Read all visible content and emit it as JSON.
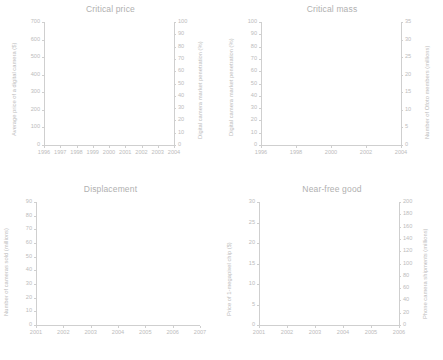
{
  "figure": {
    "layout": "2x2 grid of empty line-chart axes",
    "text_color": "#bcbcbc",
    "axis_color": "#cfcfcf",
    "background": "#ffffff"
  },
  "chart_data": [
    {
      "type": "line",
      "title": "Critical price",
      "xlabel": "",
      "ylabel": "Average price of a digital camera ($)",
      "y2label": "Digital camera market penetration (%)",
      "x": [
        "1996",
        "1997",
        "1998",
        "1999",
        "2000",
        "2001",
        "2002",
        "2003",
        "2004"
      ],
      "xticks": [
        "1996",
        "1997",
        "1998",
        "1999",
        "2000",
        "2001",
        "2002",
        "2003",
        "2004"
      ],
      "yticks": [
        "0",
        "100",
        "200",
        "300",
        "400",
        "500",
        "600",
        "700"
      ],
      "y2ticks": [
        "0",
        "10",
        "20",
        "30",
        "40",
        "50",
        "60",
        "70",
        "80",
        "90",
        "100"
      ],
      "ylim": [
        0,
        700
      ],
      "y2lim": [
        0,
        100
      ],
      "grid": false,
      "legend": "none",
      "series": []
    },
    {
      "type": "line",
      "title": "Critical mass",
      "xlabel": "",
      "ylabel": "Digital camera market penetration (%)",
      "y2label": "Number of Ofoto members (millions)",
      "x": [
        "1996",
        "1998",
        "2000",
        "2002",
        "2004"
      ],
      "xticks": [
        "1996",
        "1998",
        "2000",
        "2002",
        "2004"
      ],
      "yticks": [
        "0",
        "10",
        "20",
        "30",
        "40",
        "50",
        "60",
        "70",
        "80",
        "90",
        "100"
      ],
      "y2ticks": [
        "0",
        "5",
        "10",
        "15",
        "20",
        "25",
        "30",
        "35"
      ],
      "ylim": [
        0,
        100
      ],
      "y2lim": [
        0,
        35
      ],
      "grid": false,
      "legend": "none",
      "series": []
    },
    {
      "type": "line",
      "title": "Displacement",
      "xlabel": "",
      "ylabel": "Number of cameras sold (millions)",
      "y2label": "",
      "x": [
        "2001",
        "2002",
        "2003",
        "2004",
        "2005",
        "2006",
        "2007"
      ],
      "xticks": [
        "2001",
        "2002",
        "2003",
        "2004",
        "2005",
        "2006",
        "2007"
      ],
      "yticks": [
        "0",
        "10",
        "20",
        "30",
        "40",
        "50",
        "60",
        "70",
        "80",
        "90"
      ],
      "y2ticks": [],
      "ylim": [
        0,
        90
      ],
      "grid": false,
      "legend": "none",
      "series": []
    },
    {
      "type": "line",
      "title": "Near-free good",
      "xlabel": "",
      "ylabel": "Price of 1-megapixel chip ($)",
      "y2label": "Phone camera shipments (millions)",
      "x": [
        "2001",
        "2002",
        "2003",
        "2004",
        "2005",
        "2006"
      ],
      "xticks": [
        "2001",
        "2002",
        "2003",
        "2004",
        "2005",
        "2006"
      ],
      "yticks": [
        "0",
        "5",
        "10",
        "15",
        "20",
        "25",
        "30"
      ],
      "y2ticks": [
        "0",
        "20",
        "40",
        "60",
        "80",
        "100",
        "120",
        "140",
        "160",
        "180",
        "200"
      ],
      "ylim": [
        0,
        30
      ],
      "y2lim": [
        0,
        200
      ],
      "grid": false,
      "legend": "none",
      "series": []
    }
  ]
}
